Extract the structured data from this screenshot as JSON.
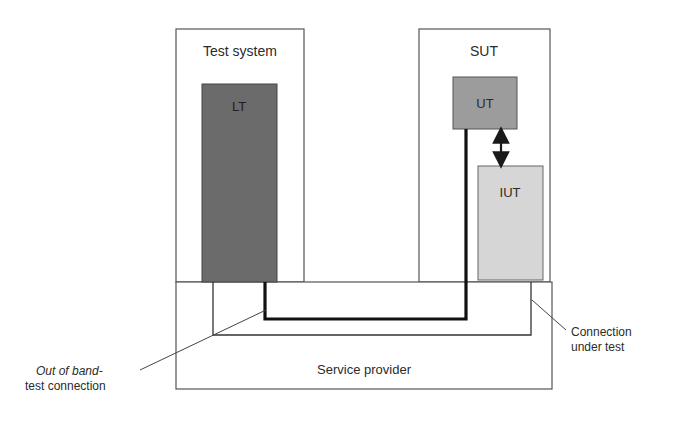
{
  "diagram": {
    "boxes": {
      "test_system": {
        "label": "Test system"
      },
      "lt": {
        "label": "LT",
        "fill": "#6b6b6b"
      },
      "sut": {
        "label": "SUT"
      },
      "ut": {
        "label": "UT",
        "fill": "#9c9c9c"
      },
      "iut": {
        "label": "IUT",
        "fill": "#d6d6d6"
      },
      "service_provider": {
        "label": "Service provider"
      }
    },
    "annotations": {
      "out_of_band_line1": "Out of band-",
      "out_of_band_line2": "test connection",
      "connection_under_test_line1": "Connection",
      "connection_under_test_line2": "under test"
    },
    "connections": [
      {
        "from": "LT",
        "to": "UT",
        "style": "thick",
        "meaning": "Out of band test connection"
      },
      {
        "from": "LT",
        "to": "IUT",
        "style": "thin",
        "meaning": "Connection under test"
      },
      {
        "from": "UT",
        "to": "IUT",
        "style": "double-arrow"
      }
    ]
  }
}
